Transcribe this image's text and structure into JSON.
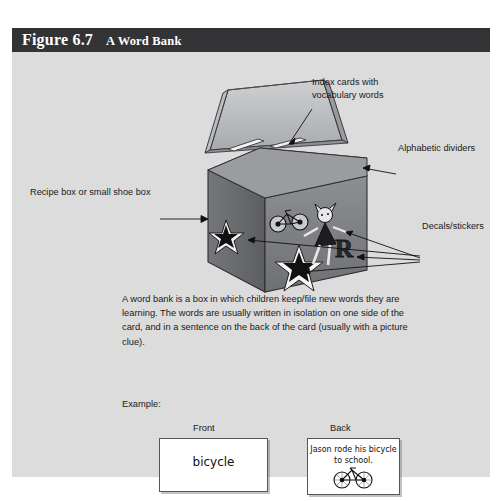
{
  "figure": {
    "number": "Figure 6.7",
    "title": "A Word Bank",
    "header_bg": "#333335",
    "panel_bg": "#dcdcdc"
  },
  "callouts": {
    "index_cards": "Index cards with\nvocabulary words",
    "alphabetic_dividers": "Alphabetic dividers",
    "recipe_box": "Recipe box or small shoe box",
    "decals": "Decals/stickers"
  },
  "dividers": {
    "labels": [
      "A",
      "B",
      "C",
      "D",
      "E"
    ]
  },
  "body": {
    "paragraph": "A word bank is a box in which children keep/file new words they are learning. The words are usually written in isolation on one side of the card, and in a sentence on the back of the card (usually with a picture clue)."
  },
  "example": {
    "label": "Example:",
    "front_label": "Front",
    "back_label": "Back",
    "front_word": "bicycle",
    "back_sentence": "Jason rode his\nbicycle to school."
  },
  "stickers": {
    "items": [
      "bicycle-sticker",
      "doll-sticker",
      "letter-r-sticker",
      "star-sticker-left",
      "star-sticker-front"
    ]
  }
}
